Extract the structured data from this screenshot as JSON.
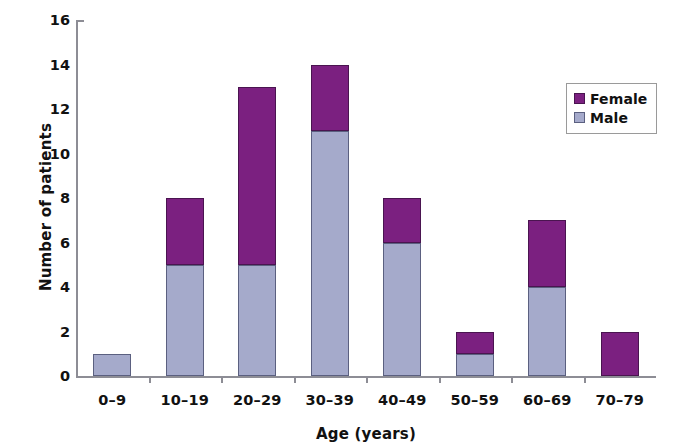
{
  "chart_data": {
    "type": "bar",
    "subtype": "stacked-vertical",
    "title": "",
    "xlabel": "Age (years)",
    "ylabel": "Number of patients",
    "categories": [
      "0–9",
      "10–19",
      "20–29",
      "30–39",
      "40–49",
      "50–59",
      "60–69",
      "70–79"
    ],
    "series": [
      {
        "name": "Male",
        "color": "#a5aacb",
        "values": [
          1,
          5,
          5,
          11,
          6,
          1,
          4,
          0
        ]
      },
      {
        "name": "Female",
        "color": "#7b2080",
        "values": [
          0,
          3,
          8,
          3,
          2,
          1,
          3,
          2
        ]
      }
    ],
    "stack_order": [
      "Male",
      "Female"
    ],
    "totals": [
      1,
      8,
      13,
      14,
      8,
      2,
      7,
      2
    ],
    "ylim": [
      0,
      16
    ],
    "ytick_values": [
      0,
      2,
      4,
      6,
      8,
      10,
      12,
      14,
      16
    ],
    "ytick_labels": [
      "0",
      "2",
      "4",
      "6",
      "8",
      "10",
      "12",
      "14",
      "16"
    ],
    "grid": false,
    "legend_position": "upper right",
    "legend_entries": [
      {
        "label": "Female",
        "color": "#7b2080"
      },
      {
        "label": "Male",
        "color": "#a5aacb"
      }
    ]
  },
  "colors": {
    "female": "#7b2080",
    "male": "#a5aacb",
    "axis": "#8d8d95",
    "text": "#111111",
    "background": "#ffffff"
  }
}
